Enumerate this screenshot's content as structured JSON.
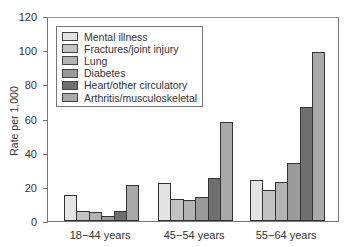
{
  "chart_data": {
    "type": "bar",
    "title": "",
    "xlabel": "",
    "ylabel": "Rate per 1,000",
    "ylim": [
      0,
      120
    ],
    "yticks": [
      0,
      20,
      40,
      60,
      80,
      100,
      120
    ],
    "grid": false,
    "legend_position": "upper-left inside plot",
    "categories": [
      "18−44 years",
      "45−54 years",
      "55−64 years"
    ],
    "series": [
      {
        "name": "Mental illness",
        "color": "#e4e4e4",
        "values": [
          15,
          22,
          24
        ]
      },
      {
        "name": "Fractures/joint injury",
        "color": "#c2c2c2",
        "values": [
          6,
          13,
          18
        ]
      },
      {
        "name": "Lung",
        "color": "#b3b3b3",
        "values": [
          5,
          12,
          23
        ]
      },
      {
        "name": "Diabetes",
        "color": "#9a9a9a",
        "values": [
          3,
          14,
          34
        ]
      },
      {
        "name": "Heart/other circulatory",
        "color": "#6f6f6f",
        "values": [
          6,
          25,
          67
        ]
      },
      {
        "name": "Arthritis/musculoskeletal",
        "color": "#a9a9a9",
        "values": [
          21,
          58,
          99
        ]
      }
    ]
  }
}
